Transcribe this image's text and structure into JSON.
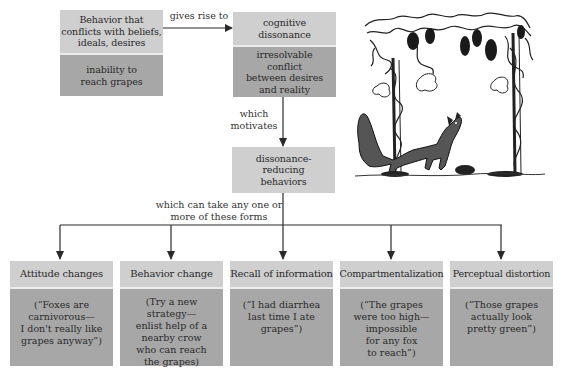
{
  "diagram": {
    "source_box": {
      "header": "Behavior that\nconflicts with beliefs,\nideals, desires",
      "example": "inability to\nreach grapes"
    },
    "arrow_1_label": "gives rise to",
    "dissonance_box": {
      "header": "cognitive\ndissonance",
      "example": "irresolvable\nconflict\nbetween desires\nand reality"
    },
    "arrow_2_label": "which\nmotivates",
    "reducing_box": {
      "header": "dissonance-\nreducing\nbehaviors"
    },
    "branch_label": "which can take any one or\nmore of these forms",
    "forms": [
      {
        "title": "Attitude changes",
        "example": "(“Foxes are\ncarnivorous—\nI don't really like\ngrapes anyway”)"
      },
      {
        "title": "Behavior change",
        "example": "(Try a new\nstrategy—\nenlist help of a\nnearby crow\nwho can reach\nthe grapes)"
      },
      {
        "title": "Recall of information",
        "example": "(“I had diarrhea\nlast time I ate\ngrapes”)"
      },
      {
        "title": "Compartmentalization",
        "example": "(“The grapes\nwere too high—\nimpossible\nfor any fox\nto reach”)"
      },
      {
        "title": "Perceptual distortion",
        "example": "(“Those grapes\nactually look\npretty green”)"
      }
    ],
    "illustration": "fox-and-grapes-illustration",
    "colors": {
      "light_box": "#cfcfcf",
      "dark_box": "#a7a7a7",
      "line": "#2a2a2a"
    }
  }
}
